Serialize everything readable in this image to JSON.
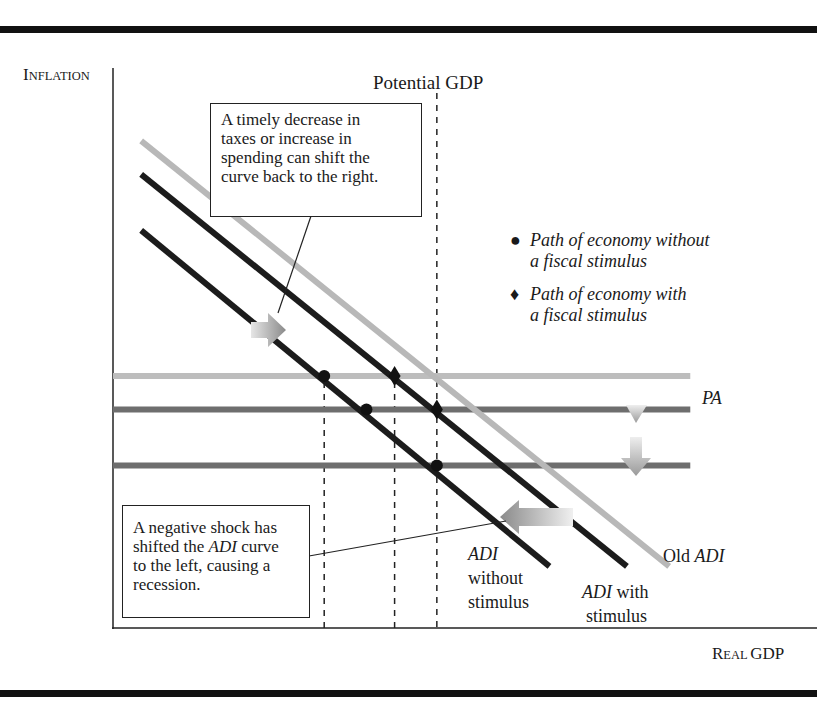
{
  "axes": {
    "y_label_cap": "I",
    "y_label_rest": "NFLATION",
    "x_label_cap1": "R",
    "x_label_rest1": "EAL ",
    "x_label_word2": "GDP"
  },
  "potential_gdp_label": "Potential GDP",
  "callouts": {
    "fiscal": {
      "lines": [
        "A timely decrease in",
        "taxes or increase in",
        "spending can shift the",
        "curve back to the right."
      ]
    },
    "shock": {
      "line1": "A negative shock has",
      "line2_pre": "shifted the ",
      "line2_italic": "ADI",
      "line2_post": " curve",
      "line3": "to the left, causing a",
      "line4": "recession."
    }
  },
  "legend": {
    "items": [
      {
        "marker": "●",
        "line1": "Path of economy without",
        "line2": "a fiscal stimulus"
      },
      {
        "marker": "♦",
        "line1": "Path of economy with",
        "line2": "a fiscal stimulus"
      }
    ]
  },
  "curve_labels": {
    "pa": "PA",
    "old_adi_pre": "Old ",
    "old_adi_italic": "ADI",
    "adi_without_italic": "ADI",
    "adi_without_l2": "without",
    "adi_without_l3": "stimulus",
    "adi_with_italic": "ADI",
    "adi_with_post": " with",
    "adi_with_l2": "stimulus"
  },
  "colors": {
    "pa_old": "#bdbdbd",
    "pa_lower": "#6e6e6e",
    "adi_dark": "#1c1c1c",
    "adi_old": "#b8b8b8",
    "frame": "#111111"
  },
  "chart_data": {
    "type": "line",
    "title": "",
    "xlabel": "Real GDP",
    "ylabel": "Inflation",
    "grid": false,
    "note": "Schematic diagram, no numeric tick values; coordinates are in abstract relative units (0-100).",
    "xlim": [
      0,
      100
    ],
    "ylim": [
      0,
      100
    ],
    "series": [
      {
        "name": "Old ADI",
        "points": [
          [
            4,
            87
          ],
          [
            79,
            11
          ]
        ]
      },
      {
        "name": "ADI with stimulus",
        "points": [
          [
            4,
            81
          ],
          [
            73,
            11
          ]
        ]
      },
      {
        "name": "ADI without stimulus",
        "points": [
          [
            4,
            71
          ],
          [
            62,
            11
          ]
        ]
      },
      {
        "name": "PA (initial)",
        "points": [
          [
            0,
            45
          ],
          [
            82,
            45
          ]
        ]
      },
      {
        "name": "PA (lower 1)",
        "points": [
          [
            0,
            39
          ],
          [
            82,
            39
          ]
        ]
      },
      {
        "name": "PA (lower 2)",
        "points": [
          [
            0,
            29
          ],
          [
            82,
            29
          ]
        ]
      }
    ],
    "vertical_lines": [
      {
        "name": "Potential GDP",
        "x": 46
      },
      {
        "name": "ref-a",
        "x": 30
      },
      {
        "name": "ref-b",
        "x": 40
      }
    ],
    "points_without_stimulus": [
      [
        30,
        45
      ],
      [
        36,
        39
      ],
      [
        46,
        29
      ]
    ],
    "points_with_stimulus": [
      [
        40,
        45
      ],
      [
        46,
        39
      ]
    ],
    "legend_position": "top-right"
  }
}
